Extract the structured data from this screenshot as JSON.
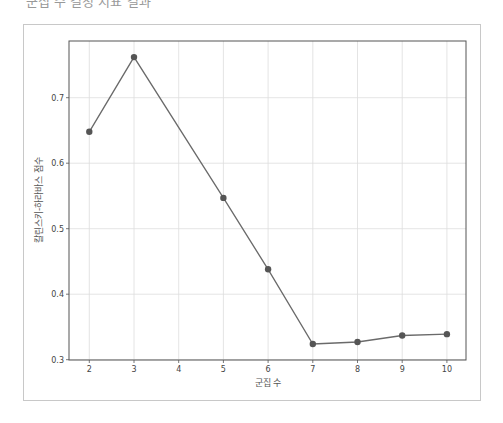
{
  "header": {
    "cut_title": "군집 수 결정 지표 결과"
  },
  "chart_data": {
    "type": "line",
    "title": "",
    "xlabel": "군집 수",
    "ylabel": "칼린스키-하라바스 점수",
    "x": [
      2,
      3,
      4,
      5,
      6,
      7,
      8,
      9,
      10
    ],
    "series": [
      {
        "name": "score",
        "x": [
          2,
          3,
          5,
          6,
          7,
          8,
          9,
          10
        ],
        "values": [
          0.648,
          0.762,
          0.547,
          0.438,
          0.324,
          0.327,
          0.337,
          0.339
        ]
      }
    ],
    "xticks": [
      "2",
      "3",
      "4",
      "5",
      "6",
      "7",
      "8",
      "9",
      "10"
    ],
    "yticks": [
      "0.3",
      "0.4",
      "0.5",
      "0.6",
      "0.7"
    ],
    "xlim": [
      1.55,
      10.45
    ],
    "ylim": [
      0.3,
      0.783
    ],
    "grid": true,
    "line_color": "#6a6a6a",
    "marker_color": "#555555",
    "grid_color": "#dddddd"
  }
}
